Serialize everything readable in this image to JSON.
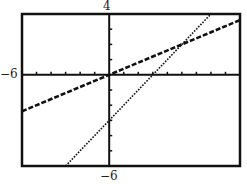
{
  "chart_data": {
    "type": "line",
    "title": "",
    "xlabel": "",
    "ylabel": "",
    "xlim": [
      -6,
      9
    ],
    "ylim": [
      -6,
      4
    ],
    "x_tick_step": 1,
    "y_tick_step": 1,
    "grid": false,
    "legend": null,
    "window_labels": {
      "ymax": "4",
      "ymin": "-6",
      "xmin": "-6"
    },
    "series": [
      {
        "name": "y = 0.4x",
        "style": "dashed-thick",
        "slope": 0.4,
        "intercept": 0,
        "points": [
          [
            -6,
            -2.4
          ],
          [
            9,
            3.6
          ]
        ]
      },
      {
        "name": "y = x - 3",
        "style": "dotted",
        "slope": 1,
        "intercept": -3,
        "points": [
          [
            -3,
            -6
          ],
          [
            7,
            4
          ]
        ]
      }
    ],
    "annotations": [
      {
        "type": "intersection",
        "x": 5,
        "y": 2
      }
    ]
  },
  "labels": {
    "top": "4",
    "bottom": "−6",
    "left": "−6"
  }
}
